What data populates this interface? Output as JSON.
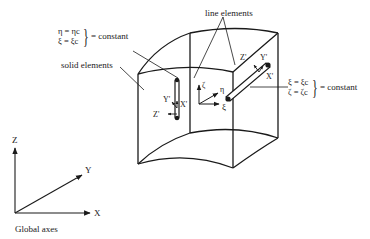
{
  "diagram": {
    "labels": {
      "line_elements": "line elements",
      "solid_elements": "solid elements",
      "global_axes": "Global axes"
    },
    "equations_left": {
      "line1": "η = ηc",
      "line2": "ξ = ξc",
      "suffix": "= constant"
    },
    "equations_right": {
      "line1": "ξ = ξc",
      "line2": "ζ = ζc",
      "suffix": "= constant"
    },
    "global_axes": {
      "z": "Z",
      "y": "Y",
      "x": "X"
    },
    "local_axes": {
      "zeta": "ζ",
      "eta": "η",
      "xi": "ξ"
    },
    "vertical_element_axes": {
      "y": "Y'",
      "x": "X'",
      "z": "Z'"
    },
    "diagonal_element_axes": {
      "z": "Z'",
      "y": "Y'",
      "x": "X'"
    },
    "colors": {
      "stroke": "#1a1a1a",
      "background": "#ffffff"
    }
  }
}
